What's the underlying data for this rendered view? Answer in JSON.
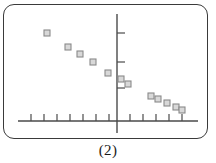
{
  "figure": {
    "caption": "(2)",
    "frame_style": "rounded-rectangle",
    "background": "#ffffff"
  },
  "colors": {
    "frame": "#3a3a3a",
    "axis": "#4a4a4a",
    "marker_stroke": "#8a8a8a",
    "marker_fill": "#d8d8d8",
    "caption_text": "#1a1a1a"
  },
  "chart_data": {
    "type": "scatter",
    "title": "",
    "subtitle": "",
    "xlabel": "",
    "ylabel": "",
    "legend": [],
    "legend_position": "none",
    "grid": false,
    "axes": {
      "x_axis_shown": true,
      "y_axis_shown": true,
      "origin_px": {
        "x": 117,
        "y": 121
      },
      "x_axis_pixel_range": [
        18,
        198
      ],
      "y_axis_pixel_range": [
        14,
        133
      ],
      "x_tick_count_left_of_origin": 7,
      "x_tick_count_right_of_origin": 5,
      "y_tick_count": 3,
      "tick_labels_shown": false
    },
    "x_ticks_px": [
      31,
      44,
      57,
      70,
      83,
      96,
      109,
      130,
      143,
      156,
      169,
      182
    ],
    "y_ticks_px": [
      33,
      62,
      88
    ],
    "marker": {
      "shape": "square",
      "size_px": 6
    },
    "points_px": [
      {
        "x": 47,
        "y": 33
      },
      {
        "x": 68,
        "y": 47
      },
      {
        "x": 80,
        "y": 54
      },
      {
        "x": 93,
        "y": 62
      },
      {
        "x": 108,
        "y": 73
      },
      {
        "x": 121,
        "y": 79
      },
      {
        "x": 128,
        "y": 84
      },
      {
        "x": 151,
        "y": 96
      },
      {
        "x": 158,
        "y": 99
      },
      {
        "x": 167,
        "y": 103
      },
      {
        "x": 176,
        "y": 107
      },
      {
        "x": 182,
        "y": 110
      }
    ],
    "x": [
      -6.8,
      -3.8,
      -2.8,
      -1.8,
      -0.7,
      0.3,
      0.8,
      2.6,
      3.2,
      3.8,
      4.5,
      5.0
    ],
    "y": [
      7.6,
      6.1,
      5.4,
      4.5,
      3.4,
      2.8,
      2.3,
      1.1,
      0.8,
      0.5,
      0.2,
      0.0
    ],
    "xlim": [
      -7.6,
      6.2
    ],
    "ylim": [
      -1.3,
      11.2
    ]
  }
}
